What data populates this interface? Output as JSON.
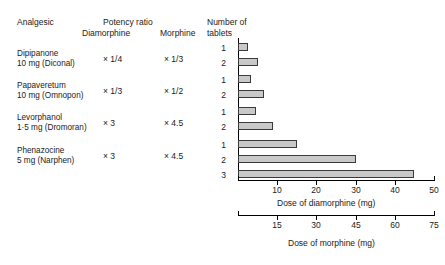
{
  "headers": {
    "analgesic": "Analgesic",
    "potency_ratio": "Potency ratio",
    "diamorphine": "Diamorphine",
    "morphine": "Morphine",
    "tablets_line1": "Number of",
    "tablets_line2": "tablets"
  },
  "rows": [
    {
      "name": "Dipipanone",
      "sub": "10 mg (Diconal)",
      "potency_diamorphine": "× 1/4",
      "potency_morphine": "× 1/3",
      "tablets": [
        "1",
        "2"
      ]
    },
    {
      "name": "Papaveretum",
      "sub": "10 mg (Omnopon)",
      "potency_diamorphine": "× 1/3",
      "potency_morphine": "× 1/2",
      "tablets": [
        "1",
        "2"
      ]
    },
    {
      "name": "Levorphanol",
      "sub": "1·5 mg (Dromoran)",
      "potency_diamorphine": "× 3",
      "potency_morphine": "× 4.5",
      "tablets": [
        "1",
        "2"
      ]
    },
    {
      "name": "Phenazocine",
      "sub": "5 mg (Narphen)",
      "potency_diamorphine": "× 3",
      "potency_morphine": "× 4.5",
      "tablets": [
        "1",
        "2",
        "3"
      ]
    }
  ],
  "axes": {
    "diamorphine": {
      "title": "Dose of diamorphine (mg)",
      "ticks": [
        "10",
        "20",
        "30",
        "40",
        "50"
      ],
      "min": 0,
      "max": 50
    },
    "morphine": {
      "title": "Dose of morphine (mg)",
      "ticks": [
        "15",
        "30",
        "45",
        "60",
        "75"
      ],
      "min": 0,
      "max": 75
    }
  },
  "colors": {
    "bar_fill": "#c9c9c9",
    "bar_stroke": "#3a3a3a",
    "axis": "#000000",
    "text": "#1a1a1a"
  },
  "chart_data": {
    "type": "bar",
    "title": "",
    "orientation": "horizontal",
    "xlabel": "Dose of diamorphine (mg)",
    "xlabel_secondary": "Dose of morphine (mg)",
    "ylabel": "Number of tablets",
    "xlim": [
      0,
      50
    ],
    "xlim_secondary": [
      0,
      75
    ],
    "grid": false,
    "legend": "none",
    "categories": [
      "Dipipanone 1 tablet",
      "Dipipanone 2 tablets",
      "Papaveretum 1 tablet",
      "Papaveretum 2 tablets",
      "Levorphanol 1 tablet",
      "Levorphanol 2 tablets",
      "Phenazocine 1 tablet",
      "Phenazocine 2 tablets",
      "Phenazocine 3 tablets"
    ],
    "values": [
      2.5,
      5,
      3.3,
      6.7,
      4.5,
      9,
      15,
      30,
      45
    ],
    "units": "mg diamorphine equivalent"
  }
}
